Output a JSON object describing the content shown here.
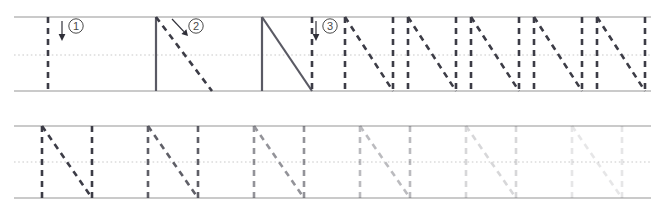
{
  "worksheet": {
    "letter": "N",
    "type": "letter-tracing-practice",
    "colors": {
      "rule_line": "#b8b8b8",
      "mid_dotted": "#c9c9c9",
      "stroke_dark": "#3c3c46",
      "stroke_solid": "#5a5a64",
      "guide_number": "#4a4a4a",
      "arrow": "#2f2f38",
      "background": "#ffffff"
    },
    "rows": [
      {
        "name": "stroke-order-row",
        "top_y": 17,
        "mid_y": 55,
        "base_y": 91,
        "cells": [
          {
            "kind": "guide",
            "step": "1",
            "step_label": "①",
            "x": 14,
            "width": 112,
            "glyph_left": 48,
            "glyph_right": 104,
            "done_strokes": [],
            "active_stroke": "left-vertical",
            "arrow": {
              "type": "down",
              "x": 62,
              "y1": 21,
              "y2": 40
            },
            "number_pos": {
              "x": 76,
              "y": 26
            }
          },
          {
            "kind": "guide",
            "step": "2",
            "step_label": "②",
            "x": 126,
            "width": 112,
            "glyph_left": 156,
            "glyph_right": 212,
            "done_strokes": [
              "left-vertical"
            ],
            "active_stroke": "diagonal",
            "arrow": {
              "type": "diagonal",
              "x1": 172,
              "y1": 19,
              "x2": 188,
              "y2": 36
            },
            "number_pos": {
              "x": 196,
              "y": 26
            }
          },
          {
            "kind": "guide",
            "step": "3",
            "step_label": "③",
            "x": 238,
            "width": 112,
            "glyph_left": 262,
            "glyph_right": 312,
            "done_strokes": [
              "left-vertical",
              "diagonal"
            ],
            "active_stroke": "right-vertical",
            "arrow": {
              "type": "down",
              "x": 316,
              "y1": 21,
              "y2": 40
            },
            "number_pos": {
              "x": 330,
              "y": 26
            }
          },
          {
            "kind": "trace",
            "glyph_left": 345,
            "glyph_right": 393,
            "opacity": 1.0
          },
          {
            "kind": "trace",
            "glyph_left": 408,
            "glyph_right": 456,
            "opacity": 1.0
          },
          {
            "kind": "trace",
            "glyph_left": 471,
            "glyph_right": 519,
            "opacity": 1.0
          },
          {
            "kind": "trace",
            "glyph_left": 534,
            "glyph_right": 582,
            "opacity": 1.0
          },
          {
            "kind": "trace",
            "glyph_left": 597,
            "glyph_right": 645,
            "opacity": 1.0
          }
        ]
      },
      {
        "name": "fading-practice-row",
        "top_y": 126,
        "mid_y": 162,
        "base_y": 198,
        "cells": [
          {
            "kind": "trace",
            "glyph_left": 42,
            "glyph_right": 92,
            "opacity": 1.0
          },
          {
            "kind": "trace",
            "glyph_left": 148,
            "glyph_right": 198,
            "opacity": 0.82
          },
          {
            "kind": "trace",
            "glyph_left": 254,
            "glyph_right": 304,
            "opacity": 0.55
          },
          {
            "kind": "trace",
            "glyph_left": 360,
            "glyph_right": 410,
            "opacity": 0.34
          },
          {
            "kind": "trace",
            "glyph_left": 466,
            "glyph_right": 516,
            "opacity": 0.2
          },
          {
            "kind": "trace",
            "glyph_left": 572,
            "glyph_right": 622,
            "opacity": 0.12
          }
        ]
      }
    ],
    "rule_extent": {
      "x1": 14,
      "x2": 651
    }
  }
}
